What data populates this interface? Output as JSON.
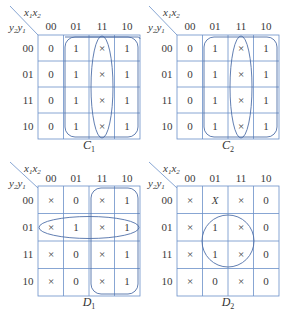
{
  "row_variables": {
    "a": "y",
    "a_sub": "2",
    "b": "y",
    "b_sub": "1"
  },
  "col_variables": {
    "a": "x",
    "a_sub": "1",
    "b": "x",
    "b_sub": "2"
  },
  "column_headers": [
    "00",
    "01",
    "11",
    "10"
  ],
  "row_headers": [
    "00",
    "01",
    "11",
    "10"
  ],
  "colors": {
    "grid": "#6a8fc8",
    "loop": "#4f6fa8",
    "text": "#3a3a3a"
  },
  "maps": [
    {
      "name": "C",
      "sub": "1",
      "cells": [
        [
          "0",
          "1",
          "×",
          "1"
        ],
        [
          "0",
          "1",
          "×",
          "1"
        ],
        [
          "0",
          "1",
          "×",
          "1"
        ],
        [
          "0",
          "1",
          "×",
          "1"
        ]
      ],
      "loops": [
        "rounded rectangle columns 01 & 10 wrapped around",
        "ellipse column 11"
      ]
    },
    {
      "name": "C",
      "sub": "2",
      "cells": [
        [
          "0",
          "1",
          "×",
          "1"
        ],
        [
          "0",
          "1",
          "×",
          "1"
        ],
        [
          "0",
          "1",
          "×",
          "1"
        ],
        [
          "0",
          "1",
          "×",
          "1"
        ]
      ],
      "loops": [
        "rounded rectangle columns 01 & 10 wrapped around",
        "ellipse column 11"
      ]
    },
    {
      "name": "D",
      "sub": "1",
      "cells": [
        [
          "×",
          "0",
          "×",
          "1"
        ],
        [
          "×",
          "1",
          "×",
          "1"
        ],
        [
          "×",
          "0",
          "×",
          "1"
        ],
        [
          "×",
          "0",
          "×",
          "1"
        ]
      ],
      "loops": [
        "ellipse row 01",
        "rounded rectangle columns 11 & 10"
      ]
    },
    {
      "name": "D",
      "sub": "2",
      "cells": [
        [
          "×",
          "X",
          "×",
          "0"
        ],
        [
          "×",
          "1",
          "×",
          "0"
        ],
        [
          "×",
          "1",
          "×",
          "0"
        ],
        [
          "×",
          "0",
          "×",
          "0"
        ]
      ],
      "loops": [
        "circle rows 01 & 11, columns 01 & 11"
      ]
    }
  ]
}
